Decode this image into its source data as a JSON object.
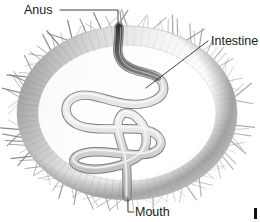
{
  "figure": {
    "background_color": "#ffffff",
    "width": 260,
    "height": 222
  },
  "labels": [
    {
      "id": "anus",
      "text": "Anus",
      "text_x": 24,
      "text_y": 14,
      "anchor": "start",
      "leader_path": "M 60 10 L 118 10 L 118 27",
      "icon_name": "leader-line-anus"
    },
    {
      "id": "intestine",
      "text": "Intestine",
      "text_x": 211,
      "text_y": 45,
      "anchor": "start",
      "leader_path": "M 208 41 L 146 88",
      "icon_name": "leader-line-intestine"
    },
    {
      "id": "mouth",
      "text": "Mouth",
      "text_x": 135,
      "text_y": 216,
      "anchor": "start",
      "leader_path": "M 128 199 L 128 212 L 133 212",
      "icon_name": "leader-line-mouth"
    }
  ],
  "anatomy": {
    "body_wall": {
      "name": "body-wall",
      "center_x": 127,
      "center_y": 113,
      "radius_x": 112,
      "radius_y": 88,
      "outer_color": "#9a9a9a",
      "inner_color": "#ffffff",
      "wall_thickness": 22
    },
    "cilia": {
      "name": "cilia-spines",
      "count": 132,
      "length_min": 7,
      "length_max": 20,
      "color": "#6e6e6e"
    },
    "intestine": {
      "name": "intestine-tube",
      "tube_color": "#c9c9c9",
      "outline_color": "#6d6d6d",
      "highlight_color": "#f2f2f2",
      "dark_segment_color": "#3a3a3a",
      "path": "M 119 27 C 120 44, 114 52, 122 62 C 132 75, 158 70, 163 84 C 168 99, 146 106, 128 104 C 108 102, 92 92, 78 96 C 63 100, 62 116, 76 124 C 92 133, 128 126, 146 130 C 162 134, 166 146, 154 152 C 141 159, 108 150, 90 152 C 74 154, 68 162, 80 167 C 96 173, 128 166, 140 155 C 150 146, 147 128, 139 120 C 133 113, 124 110, 120 117 C 115 125, 120 140, 124 152 C 128 164, 127 182, 127 197",
      "stroke_width": 7
    },
    "mouth_opening": {
      "name": "mouth-opening",
      "x": 127,
      "y": 197
    },
    "anus_opening": {
      "name": "anus-opening",
      "x": 119,
      "y": 27
    }
  },
  "corner_mark": {
    "name": "corner-copyright-mark",
    "x": 254,
    "y": 208,
    "width": 3,
    "height": 11,
    "color": "#111111"
  }
}
